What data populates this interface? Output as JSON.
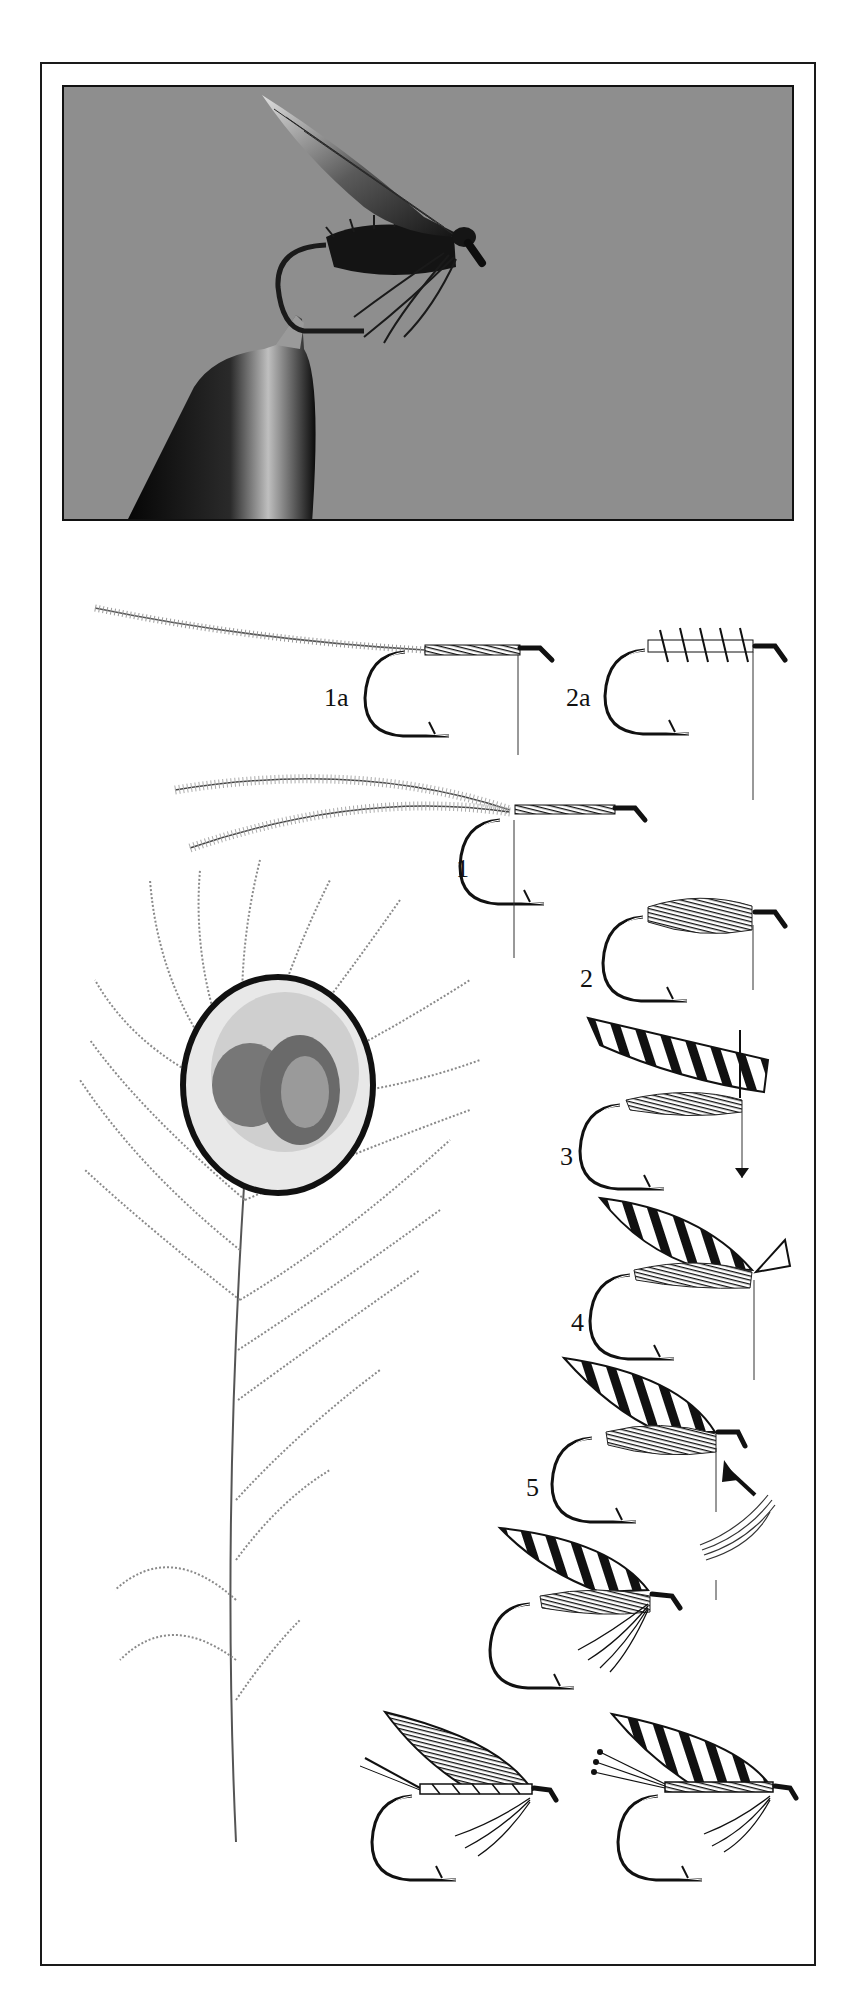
{
  "plate": {
    "photo": {
      "subject": "wet-fly-in-vise-photo",
      "background_color": "#8e8e8e"
    },
    "steps": [
      {
        "id": "1a",
        "label": "1a",
        "x": 324,
        "y": 687
      },
      {
        "id": "2a",
        "label": "2a",
        "x": 566,
        "y": 687
      },
      {
        "id": "1",
        "label": "1",
        "x": 456,
        "y": 856
      },
      {
        "id": "2",
        "label": "2",
        "x": 578,
        "y": 966
      },
      {
        "id": "3",
        "label": "3",
        "x": 560,
        "y": 1144
      },
      {
        "id": "4",
        "label": "4",
        "x": 571,
        "y": 1310
      },
      {
        "id": "5",
        "label": "5",
        "x": 526,
        "y": 1475
      }
    ],
    "illustrations": [
      "peacock-herl-strand-tied-in",
      "two-peacock-herls-tied-in",
      "herl-wound-body",
      "peacock-eye-feather",
      "wing-slip-placed",
      "wing-tied-down",
      "hackle-added",
      "finished-fly",
      "finished-fly-variant-plain-wing",
      "finished-fly-variant-barred-wing"
    ],
    "colors": {
      "ink": "#111111",
      "paper": "#ffffff",
      "frame": "#1a1a1a"
    }
  }
}
